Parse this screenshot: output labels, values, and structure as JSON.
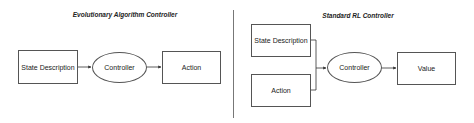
{
  "left_panel": {
    "title": "Evolutionary Algorithm Controller",
    "input": "State Description",
    "controller": "Controller",
    "output": "Action"
  },
  "right_panel": {
    "title": "Standard RL Controller",
    "inputs": [
      "State Description",
      "Action"
    ],
    "controller": "Controller",
    "output": "Value"
  }
}
